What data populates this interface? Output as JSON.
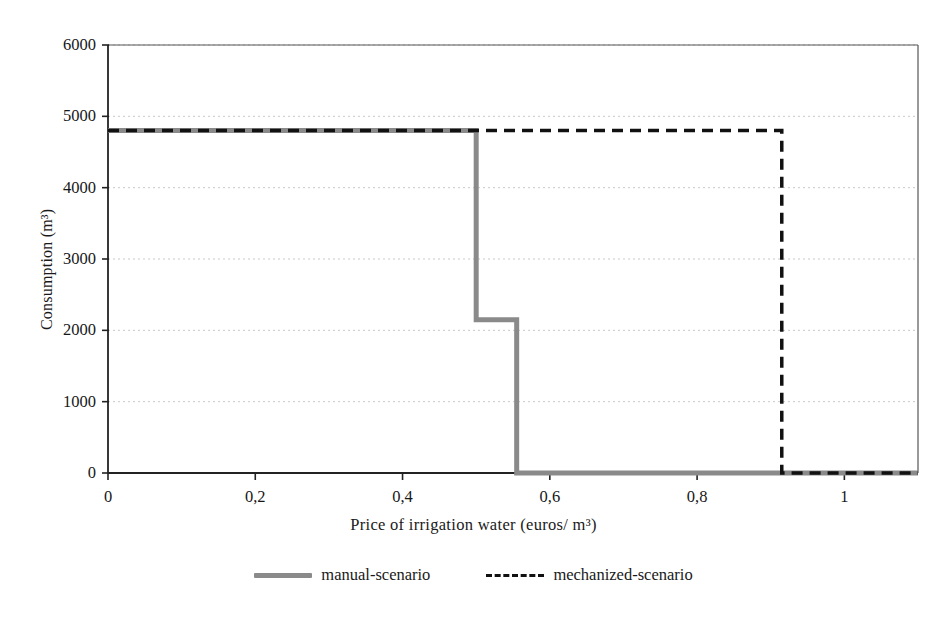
{
  "chart_data": {
    "type": "line",
    "title": "",
    "subtitle": "",
    "xlabel": "Price of irrigation water (euros/ m³)",
    "ylabel": "Consumption (m³)",
    "xlim": [
      0,
      1.1
    ],
    "ylim": [
      0,
      6000
    ],
    "xticks": [
      0,
      0.2,
      0.4,
      0.6,
      0.8,
      1
    ],
    "xtick_labels": [
      "0",
      "0,2",
      "0,4",
      "0,6",
      "0,8",
      "1"
    ],
    "yticks": [
      0,
      1000,
      2000,
      3000,
      4000,
      5000,
      6000
    ],
    "ytick_labels": [
      "0",
      "1000",
      "2000",
      "3000",
      "4000",
      "5000",
      "6000"
    ],
    "grid": "horizontal-dotted",
    "legend_position": "bottom-center",
    "series": [
      {
        "name": "manual-scenario",
        "style": "solid",
        "color": "#8a8a8a",
        "width": 5,
        "x": [
          0,
          0.5,
          0.5,
          0.555,
          0.555,
          0.5545,
          1.1
        ],
        "values": [
          4800,
          4800,
          2150,
          2150,
          0,
          0,
          0
        ],
        "points": [
          {
            "x": 0,
            "y": 4800
          },
          {
            "x": 0.5,
            "y": 4800
          },
          {
            "x": 0.5,
            "y": 2150
          },
          {
            "x": 0.555,
            "y": 2150
          },
          {
            "x": 0.555,
            "y": 0
          },
          {
            "x": 1.1,
            "y": 0
          }
        ]
      },
      {
        "name": "mechanized-scenario",
        "style": "dashed",
        "color": "#111111",
        "width": 3.5,
        "x": [
          0,
          0.915,
          0.915,
          1.1
        ],
        "values": [
          4800,
          4800,
          0,
          0
        ],
        "points": [
          {
            "x": 0,
            "y": 4800
          },
          {
            "x": 0.915,
            "y": 4800
          },
          {
            "x": 0.915,
            "y": 0
          },
          {
            "x": 1.1,
            "y": 0
          }
        ]
      }
    ]
  },
  "legend": {
    "entries": [
      {
        "label": "manual-scenario"
      },
      {
        "label": "mechanized-scenario"
      }
    ]
  }
}
